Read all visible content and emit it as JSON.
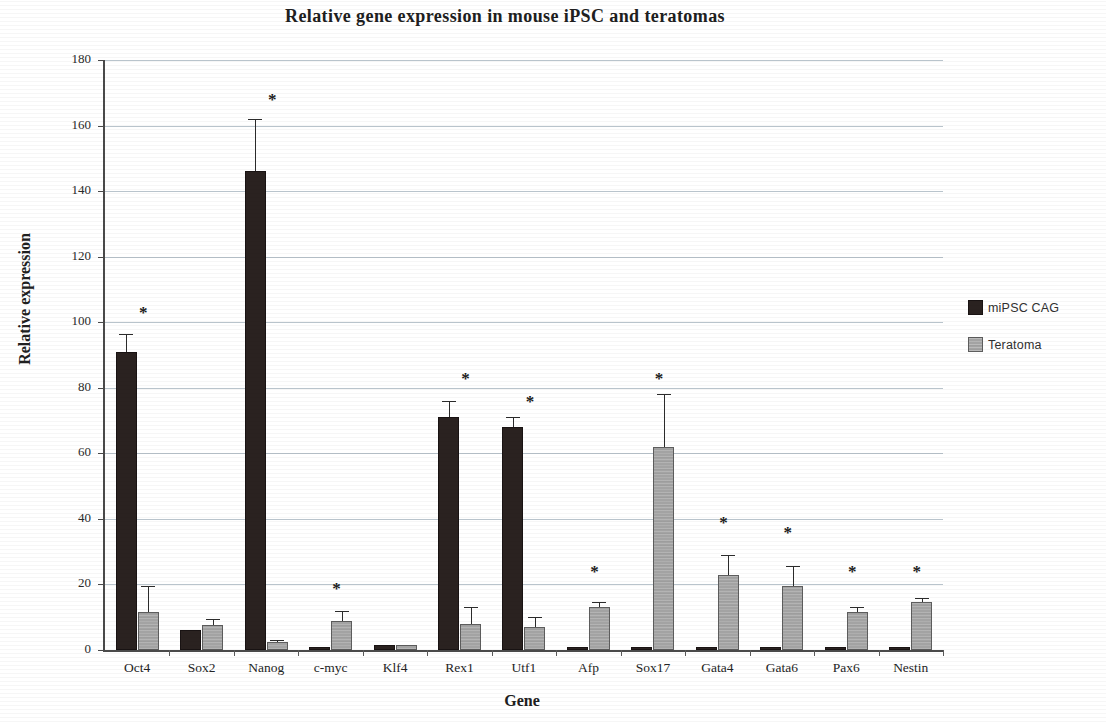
{
  "chart_data": {
    "type": "bar",
    "title": "Relative gene expression in mouse iPSC and teratomas",
    "xlabel": "Gene",
    "ylabel": "Relative expression",
    "ylim": [
      0,
      180
    ],
    "ytick_step": 20,
    "yticks": [
      0,
      20,
      40,
      60,
      80,
      100,
      120,
      140,
      160,
      180
    ],
    "grid": true,
    "legend_position": "right",
    "categories": [
      "Oct4",
      "Sox2",
      "Nanog",
      "c-myc",
      "Klf4",
      "Rex1",
      "Utf1",
      "Afp",
      "Sox17",
      "Gata4",
      "Gata6",
      "Pax6",
      "Nestin"
    ],
    "series": [
      {
        "name": "miPSC CAG",
        "color": "#2a2220",
        "values": [
          91,
          6,
          146,
          1,
          1.5,
          71,
          68,
          1,
          1,
          1,
          1,
          1,
          1
        ],
        "errors": [
          5.5,
          0,
          16,
          0,
          0,
          5,
          3,
          0,
          0,
          0,
          0,
          0,
          0
        ]
      },
      {
        "name": "Teratoma",
        "color": "#a3a3a3",
        "values": [
          11.5,
          7.5,
          2.5,
          8.8,
          1.5,
          8,
          7,
          13,
          62,
          23,
          19.5,
          11.5,
          14.5
        ],
        "errors": [
          8,
          2,
          0.5,
          3,
          0,
          5,
          3,
          1.5,
          16,
          6,
          6,
          1.5,
          1.5
        ]
      }
    ],
    "significance_markers": [
      {
        "category": "Oct4",
        "symbol": "*",
        "y": 103
      },
      {
        "category": "Nanog",
        "symbol": "*",
        "y": 168
      },
      {
        "category": "c-myc",
        "symbol": "*",
        "y": 19
      },
      {
        "category": "Rex1",
        "symbol": "*",
        "y": 83
      },
      {
        "category": "Utf1",
        "symbol": "*",
        "y": 76
      },
      {
        "category": "Afp",
        "symbol": "*",
        "y": 24
      },
      {
        "category": "Sox17",
        "symbol": "*",
        "y": 83
      },
      {
        "category": "Gata4",
        "symbol": "*",
        "y": 39
      },
      {
        "category": "Gata6",
        "symbol": "*",
        "y": 36
      },
      {
        "category": "Pax6",
        "symbol": "*",
        "y": 24
      },
      {
        "category": "Nestin",
        "symbol": "*",
        "y": 24
      }
    ]
  },
  "legend": {
    "items": [
      {
        "label": "miPSC CAG",
        "swatch": "dark"
      },
      {
        "label": "Teratoma",
        "swatch": "gray"
      }
    ]
  }
}
